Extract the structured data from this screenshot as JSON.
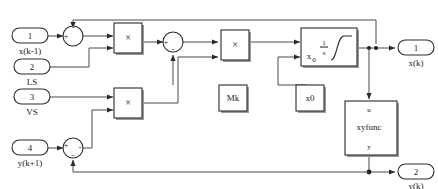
{
  "diagram": {
    "kind": "simulink-block-diagram",
    "colors": {
      "background": "#ffffff",
      "block_stroke": "#2b2b2b",
      "wire": "#4a4a4a",
      "shadow": "#9a9a9a",
      "text": "#1a1a1a"
    },
    "input_ports": [
      {
        "number": "1",
        "label": "x(k-1)"
      },
      {
        "number": "2",
        "label": "LS"
      },
      {
        "number": "3",
        "label": "VS"
      },
      {
        "number": "4",
        "label": "y(k+1)"
      }
    ],
    "output_ports": [
      {
        "number": "1",
        "label": "x(k)"
      },
      {
        "number": "2",
        "label": "y(k)"
      }
    ],
    "sum_blocks": [
      {
        "id": "sum1",
        "signs": {
          "left": "+",
          "top": "-"
        }
      },
      {
        "id": "sum2",
        "signs": {
          "left": "+",
          "bottom": "-"
        }
      },
      {
        "id": "sum3",
        "signs": {
          "left": "+",
          "right": "-",
          "bottom": "-"
        }
      }
    ],
    "product_blocks": [
      {
        "id": "prod1",
        "symbol": "×"
      },
      {
        "id": "prod2",
        "symbol": "×"
      },
      {
        "id": "prod3",
        "symbol": "×"
      }
    ],
    "constant_blocks": [
      {
        "id": "Mk",
        "label": "Mk"
      },
      {
        "id": "x0",
        "label": "x0"
      }
    ],
    "integrator_block": {
      "id": "integrator",
      "init_label": "x",
      "init_subscript": "0",
      "numerator": "1",
      "denominator": "s"
    },
    "function_block": {
      "id": "xyfunc",
      "label": "xyfunc",
      "top_port_glyph": "u",
      "bottom_port_glyph": "y"
    }
  }
}
